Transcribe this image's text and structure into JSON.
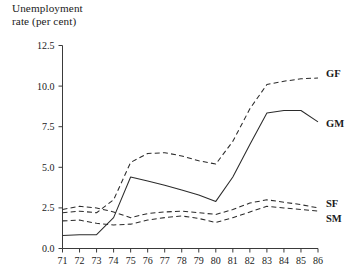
{
  "chart_data": {
    "type": "line",
    "title": "Unemployment\nrate (per cent)",
    "xlabel": "",
    "ylabel": "Unemployment rate (per cent)",
    "x": [
      71,
      72,
      73,
      74,
      75,
      76,
      77,
      78,
      79,
      80,
      81,
      82,
      83,
      84,
      85,
      86
    ],
    "xlim": [
      71,
      86
    ],
    "ylim": [
      0.0,
      12.5
    ],
    "yticks": [
      0.0,
      2.5,
      5.0,
      7.5,
      10.0,
      12.5
    ],
    "ytick_labels": [
      "0.0",
      "2.5",
      "5.0",
      "7.5",
      "10.0",
      "12.5"
    ],
    "xtick_labels": [
      "71",
      "72",
      "73",
      "74",
      "75",
      "76",
      "77",
      "78",
      "79",
      "80",
      "81",
      "82",
      "83",
      "84",
      "85",
      "86"
    ],
    "grid": false,
    "legend_position": "right-inline",
    "series": [
      {
        "name": "GF",
        "style": "dashed",
        "label": "GF",
        "values": [
          2.2,
          2.3,
          2.2,
          3.0,
          5.3,
          5.85,
          5.9,
          5.7,
          5.4,
          5.2,
          6.6,
          8.6,
          10.1,
          10.3,
          10.45,
          10.5
        ]
      },
      {
        "name": "GM",
        "style": "solid",
        "label": "GM",
        "values": [
          0.8,
          0.85,
          0.85,
          1.9,
          4.4,
          4.15,
          3.9,
          3.6,
          3.3,
          2.9,
          4.4,
          6.4,
          8.35,
          8.5,
          8.5,
          7.8
        ]
      },
      {
        "name": "SF",
        "style": "dashed",
        "label": "SF",
        "values": [
          2.4,
          2.6,
          2.5,
          2.25,
          1.9,
          2.15,
          2.25,
          2.3,
          2.2,
          2.1,
          2.4,
          2.8,
          3.0,
          2.85,
          2.7,
          2.5
        ]
      },
      {
        "name": "SM",
        "style": "dashed",
        "label": "SM",
        "values": [
          1.7,
          1.75,
          1.55,
          1.45,
          1.5,
          1.75,
          1.9,
          2.0,
          1.85,
          1.6,
          1.9,
          2.25,
          2.6,
          2.5,
          2.4,
          2.3
        ]
      }
    ]
  }
}
